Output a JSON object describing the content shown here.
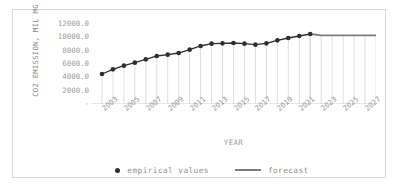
{
  "chart_data": {
    "type": "line",
    "title": "",
    "xlabel": "YEAR",
    "ylabel": "CO2 EMISSION, MIL MG",
    "xlim": [
      2002,
      2028
    ],
    "ylim": [
      0,
      12600
    ],
    "grid": false,
    "legend_position": "bottom-center",
    "y_ticks": [
      "12000.0",
      "10000.0",
      "8000.0",
      "6000.0",
      "4000.0",
      "2000.0",
      "-"
    ],
    "y_tick_values": [
      12000,
      10000,
      8000,
      6000,
      4000,
      2000,
      0
    ],
    "x_ticks": [
      "2003",
      "2005",
      "2007",
      "2009",
      "2011",
      "2013",
      "2015",
      "2017",
      "2019",
      "2021",
      "2023",
      "2025",
      "2027"
    ],
    "x_tick_values": [
      2003,
      2005,
      2007,
      2009,
      2011,
      2013,
      2015,
      2017,
      2019,
      2021,
      2023,
      2025,
      2027
    ],
    "series": [
      {
        "name": "empirical values",
        "style": "markers-line",
        "color": "#2e2e2e",
        "x": [
          2003,
          2004,
          2005,
          2006,
          2007,
          2008,
          2009,
          2010,
          2011,
          2012,
          2013,
          2014,
          2015,
          2016,
          2017,
          2018,
          2019,
          2020,
          2021,
          2022
        ],
        "values": [
          4500,
          5200,
          5750,
          6200,
          6700,
          7200,
          7400,
          7650,
          8150,
          8700,
          9050,
          9100,
          9150,
          9050,
          8900,
          9100,
          9550,
          9900,
          10200,
          10500
        ]
      },
      {
        "name": "forecast",
        "style": "line",
        "color": "#7d7d7d",
        "x": [
          2022,
          2023,
          2024,
          2025,
          2026,
          2027,
          2028
        ],
        "values": [
          10500,
          10300,
          10300,
          10300,
          10300,
          10300,
          10300
        ]
      }
    ]
  },
  "legend": {
    "empirical_label": "empirical values",
    "forecast_label": "forecast"
  },
  "colors": {
    "empirical": "#2e2e2e",
    "forecast": "#7d7d7d",
    "axis_text": "#9a9a9a",
    "frame": "#d9d9d9",
    "droplines": "#d5d5d5"
  }
}
